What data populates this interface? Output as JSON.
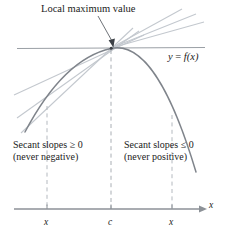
{
  "figure": {
    "annotations": {
      "local_max": "Local maximum value",
      "function_label_y": "y",
      "function_label_eq": " = ",
      "function_label_f": "f",
      "function_label_arg": "(x)"
    },
    "left_region": {
      "line1": "Secant slopes ≥ 0",
      "line2": "(never negative)"
    },
    "right_region": {
      "line1": "Secant slopes ≤ 0",
      "line2": "(never positive)"
    },
    "axis": {
      "label": "x",
      "ticks": [
        {
          "name": "left-x",
          "label": "x",
          "x": 47
        },
        {
          "name": "center-c",
          "label": "c",
          "x": 111
        },
        {
          "name": "right-x",
          "label": "x",
          "x": 172
        }
      ]
    },
    "colors": {
      "curve": "#7a7f86",
      "secant": "#b9bec4",
      "tangent": "#8f949a",
      "dashed": "#b0b5bb",
      "axis": "#8c9197",
      "text": "#1b1b1b",
      "background": "#ffffff"
    },
    "geometry": {
      "peak": {
        "x": 111,
        "y": 48
      },
      "axis_y": 209,
      "curve_left_end": {
        "x": 25,
        "y": 132
      },
      "curve_right_end": {
        "x": 196,
        "y": 172
      }
    }
  }
}
